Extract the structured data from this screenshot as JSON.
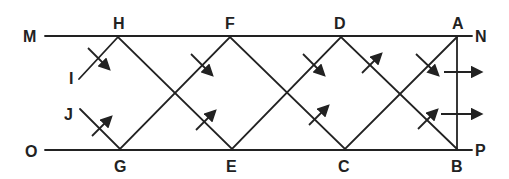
{
  "diagram": {
    "type": "ray-reflection-between-parallel-mirrors",
    "colors": {
      "stroke": "#222222",
      "background": "#ffffff"
    },
    "labels": {
      "M": "M",
      "N": "N",
      "O": "O",
      "P": "P",
      "H": "H",
      "F": "F",
      "D": "D",
      "A": "A",
      "G": "G",
      "E": "E",
      "C": "C",
      "B": "B",
      "I": "I",
      "J": "J"
    },
    "top_line": {
      "from": "M",
      "to": "N",
      "points_on_line": [
        "H",
        "F",
        "D",
        "A"
      ]
    },
    "bottom_line": {
      "from": "O",
      "to": "P",
      "points_on_line": [
        "G",
        "E",
        "C",
        "B"
      ]
    },
    "vertical_segment": [
      "A",
      "B"
    ],
    "zigzag_paths": [
      [
        "I",
        "H",
        "E",
        "D",
        "B"
      ],
      [
        "J",
        "G",
        "F",
        "C",
        "A"
      ]
    ],
    "output_arrows": 2
  }
}
